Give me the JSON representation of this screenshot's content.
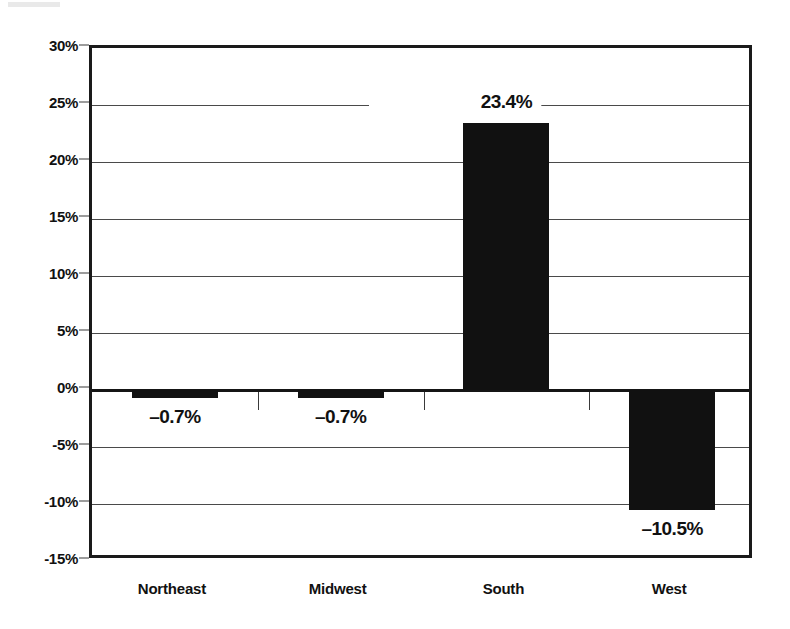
{
  "chart_data": {
    "type": "bar",
    "title": "",
    "subtitle": "",
    "xlabel": "",
    "ylabel": "",
    "categories": [
      "Northeast",
      "Midwest",
      "South",
      "West"
    ],
    "values": [
      -0.7,
      -0.7,
      23.4,
      -10.5
    ],
    "data_labels": [
      "–0.7%",
      "–0.7%",
      "23.4%",
      "–10.5%"
    ],
    "ylim": [
      -15,
      30
    ],
    "ytick_values": [
      30,
      25,
      20,
      15,
      10,
      5,
      0,
      -5,
      -10,
      -15
    ],
    "ytick_labels": [
      "30%",
      "25%",
      "20%",
      "15%",
      "10%",
      "5%",
      "0%",
      "-5%",
      "-10%",
      "-15%"
    ],
    "grid": true,
    "legend": false,
    "legend_position": "none",
    "bar_color": "#111111",
    "gridline_color": "#4a4a4a",
    "axis_color": "#1a1a1a",
    "background_color": "#ffffff",
    "label_value_format": "percent-one-decimal"
  }
}
